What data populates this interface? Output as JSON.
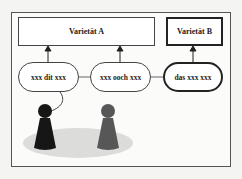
{
  "diagram": {
    "boxes": [
      {
        "label": "Varietät A",
        "style": "thin"
      },
      {
        "label": "Varietät B",
        "style": "thick"
      }
    ],
    "ovals": [
      {
        "label": "xxx dit xxx",
        "maps_to": "Varietät A"
      },
      {
        "label": "xxx ooch xxx",
        "maps_to": "Varietät A"
      },
      {
        "label": "das xxx xxx",
        "maps_to": "Varietät B"
      }
    ],
    "figures": [
      {
        "name": "speaker",
        "color": "#1a1a1a"
      },
      {
        "name": "listener",
        "color": "#555555"
      }
    ],
    "colors": {
      "shadow": "#d8d8d6",
      "line": "#333333"
    }
  }
}
